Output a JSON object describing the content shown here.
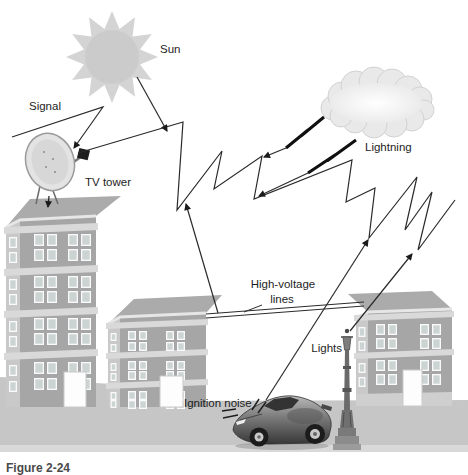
{
  "figure": {
    "caption": "Figure 2-24",
    "labels": {
      "sun": "Sun",
      "signal": "Signal",
      "tv_tower": "TV tower",
      "lightning": "Lightning",
      "high_voltage_line1": "High-voltage",
      "high_voltage_line2": "lines",
      "lights": "Lights",
      "ignition_noise": "Ignition noise"
    },
    "colors": {
      "background": "#ffffff",
      "ground": "#c6c6c6",
      "building_front": "#a6a6a6",
      "building_side": "#c9c9c9",
      "roof": "#ababab",
      "slab": "#d9d9d9",
      "window": "#fafafa",
      "line": "#2b2b2b",
      "sun": "#d4d4d4",
      "cloud": "#e9e9e9"
    }
  }
}
